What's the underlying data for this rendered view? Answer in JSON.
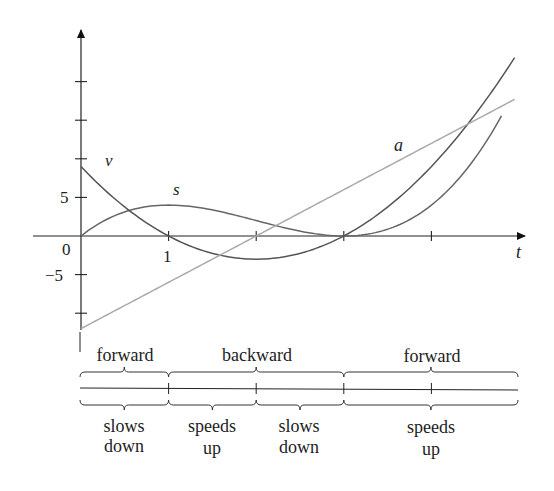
{
  "chart_data": {
    "type": "line",
    "title": "",
    "xlabel": "t",
    "ylabel": "",
    "xlim": [
      -0.55,
      5.0
    ],
    "ylim": [
      -12,
      22
    ],
    "grid": false,
    "x_ticks": [
      1,
      2,
      3,
      4
    ],
    "y_ticks": [
      -10,
      -5,
      5,
      10,
      15,
      20
    ],
    "tick_labels": {
      "origin": "0",
      "x_one": "1",
      "y_five": "5",
      "y_neg_five": "−5"
    },
    "series": [
      {
        "name": "s",
        "formula": "t^3 - 6t^2 + 9t",
        "color": "#666666",
        "x": [
          0,
          0.5,
          1,
          1.5,
          2,
          2.5,
          3,
          3.5,
          4,
          4.8
        ],
        "y": [
          0,
          3.125,
          4,
          3.375,
          2,
          0.625,
          0,
          0.875,
          4,
          14.1
        ]
      },
      {
        "name": "v",
        "formula": "3t^2 - 12t + 9",
        "color": "#555555",
        "x": [
          0,
          0.5,
          1,
          1.5,
          2,
          2.5,
          3,
          3.5,
          4,
          4.95
        ],
        "y": [
          9,
          3.75,
          0,
          -2.25,
          -3,
          -2.25,
          0,
          3.75,
          9,
          23.1
        ]
      },
      {
        "name": "a",
        "formula": "6t - 12",
        "color": "#aaaaaa",
        "x": [
          0,
          4.95
        ],
        "y": [
          -12,
          17.7
        ]
      }
    ],
    "curve_labels": [
      {
        "text": "v",
        "x": 0.3,
        "y": 10
      },
      {
        "text": "s",
        "x": 1.1,
        "y": 6
      },
      {
        "text": "a",
        "x": 3.6,
        "y": 14.5
      }
    ]
  },
  "number_line": {
    "direction_labels": [
      {
        "text": "forward",
        "t_from": 0,
        "t_to": 1
      },
      {
        "text": "backward",
        "t_from": 1,
        "t_to": 3
      },
      {
        "text": "forward",
        "t_from": 3,
        "t_to": 5
      }
    ],
    "speed_labels": [
      {
        "line1": "slows",
        "line2": "down",
        "t_from": 0,
        "t_to": 1
      },
      {
        "line1": "speeds",
        "line2": "up",
        "t_from": 1,
        "t_to": 2
      },
      {
        "line1": "slows",
        "line2": "down",
        "t_from": 2,
        "t_to": 3
      },
      {
        "line1": "speeds",
        "line2": "up",
        "t_from": 3,
        "t_to": 5
      }
    ]
  }
}
